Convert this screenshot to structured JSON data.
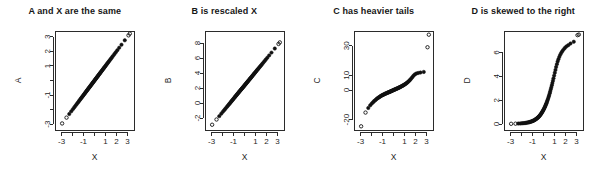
{
  "figure": {
    "width": 598,
    "height": 176,
    "background": "#ffffff",
    "foreground": "#111111",
    "layout": "1 row x 4 columns"
  },
  "chart_data": [
    {
      "type": "scatter",
      "panel": "A",
      "title": "A and X are the same",
      "xlabel": "X",
      "ylabel": "A",
      "xlim": [
        -3.6,
        3.6
      ],
      "ylim": [
        -3.4,
        3.4
      ],
      "xticks": [
        -3,
        -2,
        -1,
        0,
        1,
        2,
        3
      ],
      "xtick_labels": [
        "-3",
        "",
        "-1",
        "",
        "1",
        "2",
        "3"
      ],
      "yticks": [
        -3,
        -2,
        -1,
        0,
        1,
        2,
        3
      ],
      "ytick_labels": [
        "-3",
        "",
        "-1",
        "",
        "1",
        "2",
        "3"
      ],
      "grid": false,
      "legend": "none",
      "description": "Q-Q plot: A plotted against X falls on a straight 45-degree line, identical distributions",
      "x": [
        -2.95,
        -2.55,
        -2.3,
        -2.12,
        -1.98,
        -1.86,
        -1.76,
        -1.66,
        -1.57,
        -1.49,
        -1.41,
        -1.34,
        -1.27,
        -1.21,
        -1.15,
        -1.09,
        -1.03,
        -0.98,
        -0.92,
        -0.87,
        -0.82,
        -0.77,
        -0.72,
        -0.68,
        -0.63,
        -0.59,
        -0.54,
        -0.5,
        -0.46,
        -0.41,
        -0.37,
        -0.33,
        -0.29,
        -0.25,
        -0.21,
        -0.17,
        -0.13,
        -0.09,
        -0.05,
        -0.01,
        0.03,
        0.07,
        0.11,
        0.15,
        0.19,
        0.23,
        0.27,
        0.31,
        0.35,
        0.39,
        0.44,
        0.48,
        0.52,
        0.57,
        0.61,
        0.66,
        0.71,
        0.76,
        0.81,
        0.86,
        0.91,
        0.97,
        1.03,
        1.09,
        1.15,
        1.22,
        1.29,
        1.36,
        1.44,
        1.52,
        1.61,
        1.71,
        1.82,
        1.94,
        2.08,
        2.25,
        2.46,
        2.76,
        3.1,
        3.22
      ],
      "y": [
        -2.95,
        -2.55,
        -2.3,
        -2.12,
        -1.98,
        -1.86,
        -1.76,
        -1.66,
        -1.57,
        -1.49,
        -1.41,
        -1.34,
        -1.27,
        -1.21,
        -1.15,
        -1.09,
        -1.03,
        -0.98,
        -0.92,
        -0.87,
        -0.82,
        -0.77,
        -0.72,
        -0.68,
        -0.63,
        -0.59,
        -0.54,
        -0.5,
        -0.46,
        -0.41,
        -0.37,
        -0.33,
        -0.29,
        -0.25,
        -0.21,
        -0.17,
        -0.13,
        -0.09,
        -0.05,
        -0.01,
        0.03,
        0.07,
        0.11,
        0.15,
        0.19,
        0.23,
        0.27,
        0.31,
        0.35,
        0.39,
        0.44,
        0.48,
        0.52,
        0.57,
        0.61,
        0.66,
        0.71,
        0.76,
        0.81,
        0.86,
        0.91,
        0.97,
        1.03,
        1.09,
        1.15,
        1.22,
        1.29,
        1.36,
        1.44,
        1.52,
        1.61,
        1.71,
        1.82,
        1.94,
        2.08,
        2.25,
        2.46,
        2.76,
        3.1,
        3.22
      ]
    },
    {
      "type": "scatter",
      "panel": "B",
      "title": "B is rescaled X",
      "xlabel": "X",
      "ylabel": "B",
      "xlim": [
        -3.6,
        3.6
      ],
      "ylim": [
        -3.6,
        9.6
      ],
      "xticks": [
        -3,
        -2,
        -1,
        0,
        1,
        2,
        3
      ],
      "xtick_labels": [
        "-3",
        "",
        "-1",
        "",
        "1",
        "2",
        "3"
      ],
      "yticks": [
        -2,
        0,
        2,
        4,
        6,
        8
      ],
      "ytick_labels": [
        "-2",
        "0",
        "2",
        "4",
        "6",
        "8"
      ],
      "grid": false,
      "legend": "none",
      "description": "Q-Q plot: B is a linear rescaling of X, points lie on a straight line with different slope/intercept",
      "x": [
        -2.95,
        -2.55,
        -2.3,
        -2.12,
        -1.98,
        -1.86,
        -1.76,
        -1.66,
        -1.57,
        -1.49,
        -1.41,
        -1.34,
        -1.27,
        -1.21,
        -1.15,
        -1.09,
        -1.03,
        -0.98,
        -0.92,
        -0.87,
        -0.82,
        -0.77,
        -0.72,
        -0.68,
        -0.63,
        -0.59,
        -0.54,
        -0.5,
        -0.46,
        -0.41,
        -0.37,
        -0.33,
        -0.29,
        -0.25,
        -0.21,
        -0.17,
        -0.13,
        -0.09,
        -0.05,
        -0.01,
        0.03,
        0.07,
        0.11,
        0.15,
        0.19,
        0.23,
        0.27,
        0.31,
        0.35,
        0.39,
        0.44,
        0.48,
        0.52,
        0.57,
        0.61,
        0.66,
        0.71,
        0.76,
        0.81,
        0.86,
        0.91,
        0.97,
        1.03,
        1.09,
        1.15,
        1.22,
        1.29,
        1.36,
        1.44,
        1.52,
        1.61,
        1.71,
        1.82,
        1.94,
        2.08,
        2.25,
        2.46,
        2.76,
        3.1,
        3.22
      ],
      "y": [
        -2.9,
        -2.2,
        -1.75,
        -1.43,
        -1.18,
        -0.97,
        -0.79,
        -0.61,
        -0.45,
        -0.31,
        -0.17,
        -0.05,
        0.08,
        0.19,
        0.29,
        0.4,
        0.51,
        0.6,
        0.71,
        0.8,
        0.89,
        0.98,
        1.07,
        1.14,
        1.23,
        1.3,
        1.39,
        1.46,
        1.53,
        1.62,
        1.69,
        1.76,
        1.83,
        1.9,
        1.97,
        2.04,
        2.11,
        2.18,
        2.25,
        2.32,
        2.39,
        2.46,
        2.53,
        2.6,
        2.68,
        2.75,
        2.82,
        2.89,
        2.96,
        3.03,
        3.12,
        3.19,
        3.26,
        3.35,
        3.42,
        3.51,
        3.6,
        3.69,
        3.78,
        3.87,
        3.96,
        4.06,
        4.17,
        4.28,
        4.39,
        4.51,
        4.63,
        4.76,
        4.9,
        5.04,
        5.2,
        5.38,
        5.58,
        5.79,
        6.04,
        6.35,
        6.72,
        7.26,
        7.87,
        8.08
      ]
    },
    {
      "type": "scatter",
      "panel": "C",
      "title": "C has heavier tails",
      "xlabel": "X",
      "ylabel": "C",
      "xlim": [
        -3.6,
        3.6
      ],
      "ylim": [
        -27,
        40
      ],
      "xticks": [
        -3,
        -2,
        -1,
        0,
        1,
        2,
        3
      ],
      "xtick_labels": [
        "-3",
        "",
        "-1",
        "",
        "1",
        "2",
        "3"
      ],
      "yticks": [
        -20,
        0,
        10,
        30
      ],
      "ytick_labels": [
        "-20",
        "0",
        "10",
        "30"
      ],
      "grid": false,
      "legend": "none",
      "description": "Q-Q plot: C has heavier tails than X, producing an S-shaped curve with extreme outliers at both ends",
      "x": [
        -2.95,
        -2.55,
        -2.3,
        -2.12,
        -1.98,
        -1.86,
        -1.76,
        -1.66,
        -1.57,
        -1.49,
        -1.41,
        -1.34,
        -1.27,
        -1.21,
        -1.15,
        -1.09,
        -1.03,
        -0.98,
        -0.92,
        -0.87,
        -0.82,
        -0.77,
        -0.72,
        -0.68,
        -0.63,
        -0.59,
        -0.54,
        -0.5,
        -0.46,
        -0.41,
        -0.37,
        -0.33,
        -0.29,
        -0.25,
        -0.21,
        -0.17,
        -0.13,
        -0.09,
        -0.05,
        -0.01,
        0.03,
        0.07,
        0.11,
        0.15,
        0.19,
        0.23,
        0.27,
        0.31,
        0.35,
        0.39,
        0.44,
        0.48,
        0.52,
        0.57,
        0.61,
        0.66,
        0.71,
        0.76,
        0.81,
        0.86,
        0.91,
        0.97,
        1.03,
        1.09,
        1.15,
        1.22,
        1.29,
        1.36,
        1.44,
        1.52,
        1.61,
        1.71,
        1.82,
        1.94,
        2.08,
        2.25,
        2.46,
        2.76,
        3.1,
        3.22
      ],
      "y": [
        -24.5,
        -15.2,
        -12.1,
        -10.3,
        -9.1,
        -8.2,
        -7.4,
        -6.8,
        -6.2,
        -5.7,
        -5.3,
        -4.9,
        -4.6,
        -4.3,
        -4.0,
        -3.7,
        -3.5,
        -3.3,
        -3.1,
        -2.9,
        -2.7,
        -2.5,
        -2.4,
        -2.2,
        -2.1,
        -1.9,
        -1.8,
        -1.6,
        -1.5,
        -1.4,
        -1.2,
        -1.1,
        -1.0,
        -0.8,
        -0.7,
        -0.6,
        -0.4,
        -0.3,
        -0.2,
        0.0,
        0.1,
        0.2,
        0.4,
        0.5,
        0.6,
        0.8,
        0.9,
        1.0,
        1.2,
        1.3,
        1.5,
        1.6,
        1.8,
        1.9,
        2.1,
        2.3,
        2.5,
        2.7,
        2.9,
        3.1,
        3.3,
        3.6,
        3.9,
        4.2,
        4.5,
        4.9,
        5.3,
        5.8,
        6.4,
        7.0,
        7.8,
        8.7,
        9.7,
        10.6,
        11.2,
        11.6,
        11.9,
        12.3,
        29.0,
        37.5
      ]
    },
    {
      "type": "scatter",
      "panel": "D",
      "title": "D is skewed to the right",
      "xlabel": "X",
      "ylabel": "D",
      "xlim": [
        -3.6,
        3.6
      ],
      "ylim": [
        -0.5,
        7.8
      ],
      "xticks": [
        -3,
        -2,
        -1,
        0,
        1,
        2,
        3
      ],
      "xtick_labels": [
        "-3",
        "",
        "-1",
        "",
        "1",
        "2",
        "3"
      ],
      "yticks": [
        0,
        2,
        4,
        6
      ],
      "ytick_labels": [
        "0",
        "2",
        "4",
        "6"
      ],
      "grid": false,
      "legend": "none",
      "description": "Q-Q plot: D is right-skewed relative to X, producing a convex upward-curving pattern",
      "x": [
        -2.95,
        -2.55,
        -2.3,
        -2.12,
        -1.98,
        -1.86,
        -1.76,
        -1.66,
        -1.57,
        -1.49,
        -1.41,
        -1.34,
        -1.27,
        -1.21,
        -1.15,
        -1.09,
        -1.03,
        -0.98,
        -0.92,
        -0.87,
        -0.82,
        -0.77,
        -0.72,
        -0.68,
        -0.63,
        -0.59,
        -0.54,
        -0.5,
        -0.46,
        -0.41,
        -0.37,
        -0.33,
        -0.29,
        -0.25,
        -0.21,
        -0.17,
        -0.13,
        -0.09,
        -0.05,
        -0.01,
        0.03,
        0.07,
        0.11,
        0.15,
        0.19,
        0.23,
        0.27,
        0.31,
        0.35,
        0.39,
        0.44,
        0.48,
        0.52,
        0.57,
        0.61,
        0.66,
        0.71,
        0.76,
        0.81,
        0.86,
        0.91,
        0.97,
        1.03,
        1.09,
        1.15,
        1.22,
        1.29,
        1.36,
        1.44,
        1.52,
        1.61,
        1.71,
        1.82,
        1.94,
        2.08,
        2.25,
        2.46,
        2.76,
        3.1,
        3.22
      ],
      "y": [
        0.02,
        0.03,
        0.04,
        0.05,
        0.06,
        0.07,
        0.08,
        0.09,
        0.1,
        0.12,
        0.13,
        0.15,
        0.16,
        0.18,
        0.2,
        0.22,
        0.24,
        0.26,
        0.28,
        0.31,
        0.33,
        0.36,
        0.39,
        0.42,
        0.45,
        0.48,
        0.52,
        0.55,
        0.59,
        0.63,
        0.68,
        0.72,
        0.77,
        0.82,
        0.87,
        0.93,
        0.99,
        1.05,
        1.11,
        1.18,
        1.25,
        1.32,
        1.4,
        1.48,
        1.57,
        1.66,
        1.75,
        1.85,
        1.95,
        2.06,
        2.19,
        2.31,
        2.44,
        2.59,
        2.73,
        2.9,
        3.07,
        3.25,
        3.44,
        3.63,
        3.83,
        4.06,
        4.3,
        4.54,
        4.78,
        5.02,
        5.24,
        5.44,
        5.63,
        5.8,
        5.95,
        6.1,
        6.24,
        6.37,
        6.5,
        6.61,
        6.75,
        6.9,
        7.45,
        7.5
      ]
    }
  ]
}
